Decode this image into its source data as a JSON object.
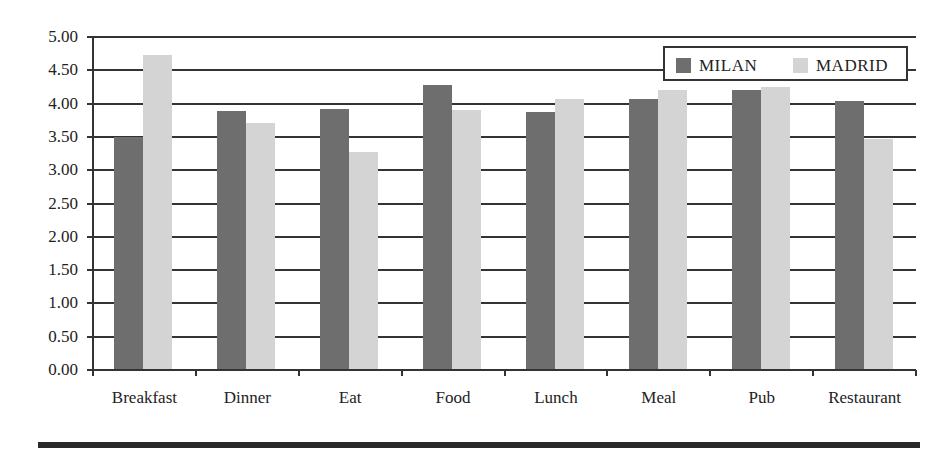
{
  "chart_data": {
    "type": "bar",
    "title": "",
    "xlabel": "",
    "ylabel": "",
    "categories": [
      "Breakfast",
      "Dinner",
      "Eat",
      "Food",
      "Lunch",
      "Meal",
      "Pub",
      "Restaurant"
    ],
    "series": [
      {
        "name": "MILAN",
        "color": "#6e6e6e",
        "values": [
          3.5,
          3.89,
          3.92,
          4.28,
          3.88,
          4.07,
          4.2,
          4.04
        ]
      },
      {
        "name": "MADRID",
        "color": "#d4d4d4",
        "values": [
          4.73,
          3.71,
          3.27,
          3.9,
          4.07,
          4.21,
          4.25,
          3.47
        ]
      }
    ],
    "ylim": [
      0,
      5
    ],
    "yticks": [
      "0.00",
      "0.50",
      "1.00",
      "1.50",
      "2.00",
      "2.50",
      "3.00",
      "3.50",
      "4.00",
      "4.50",
      "5.00"
    ],
    "grid": true,
    "legend_position": "top-right"
  },
  "legend": {
    "items": [
      {
        "label": "MILAN",
        "color": "#6e6e6e"
      },
      {
        "label": "MADRID",
        "color": "#d4d4d4"
      }
    ]
  }
}
